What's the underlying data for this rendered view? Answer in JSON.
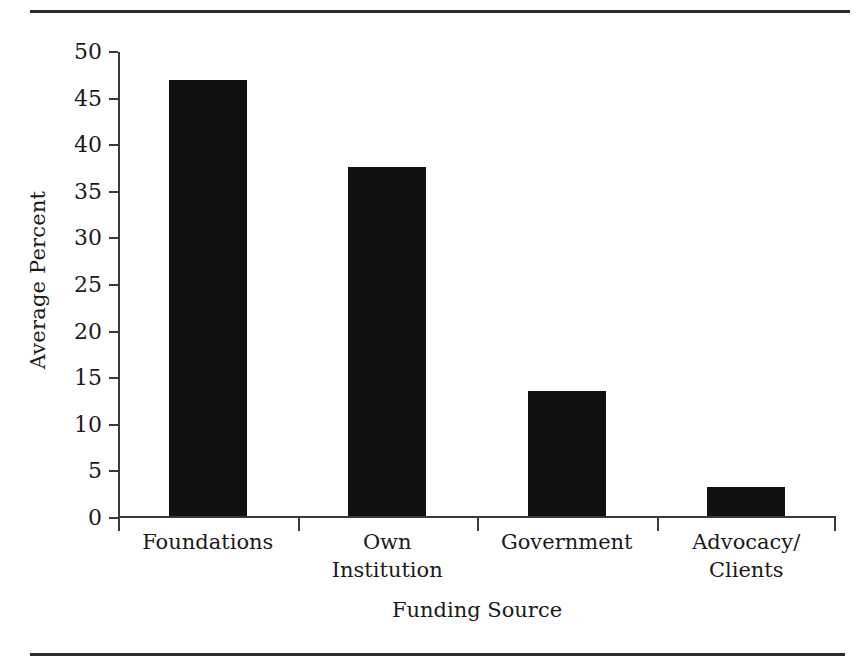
{
  "figure": {
    "rules": {
      "top": "horizontal-rule",
      "bottom": "horizontal-rule"
    }
  },
  "chart_data": {
    "type": "bar",
    "title": "",
    "categories": [
      "Foundations",
      "Own Institution",
      "Government",
      "Advocacy/ Clients"
    ],
    "category_lines": [
      [
        "Foundations",
        ""
      ],
      [
        "Own",
        "Institution"
      ],
      [
        "Government",
        ""
      ],
      [
        "Advocacy/",
        "Clients"
      ]
    ],
    "values": [
      46.8,
      37.4,
      13.4,
      3.1
    ],
    "xlabel": "Funding Source",
    "ylabel": "Average Percent",
    "ylim": [
      0,
      50
    ],
    "ytick_values": [
      50,
      45,
      40,
      35,
      30,
      25,
      20,
      15,
      10,
      5,
      0
    ],
    "ytick_labels": [
      "50",
      "45",
      "40",
      "35",
      "30",
      "25",
      "20",
      "15",
      "10",
      "5",
      "0"
    ],
    "grid": false,
    "legend": false,
    "bar_color": "#111111",
    "axis_color": "#3a3a3a"
  }
}
